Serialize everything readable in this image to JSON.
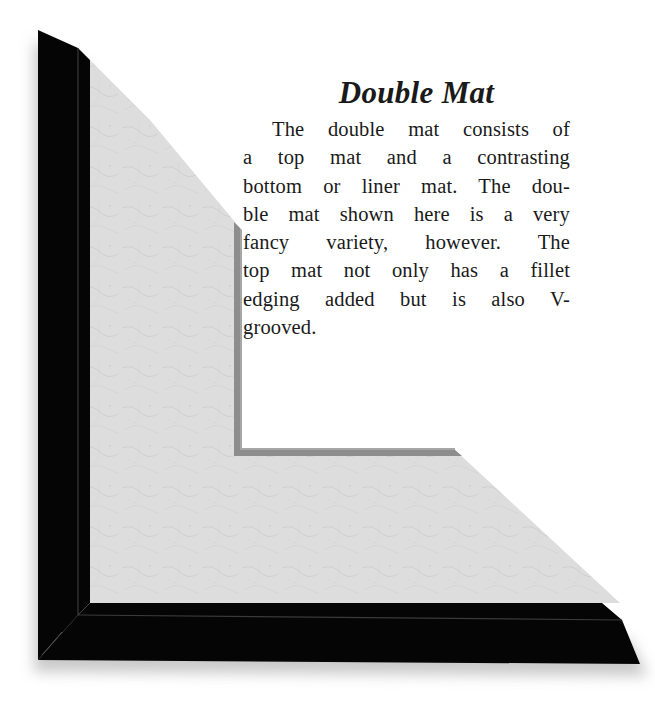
{
  "heading": "Double Mat",
  "body": {
    "lines": [
      "The double mat consists of",
      "a top mat and a contrasting",
      "bottom or liner mat. The dou-",
      "ble mat shown here is a very",
      "fancy variety, however. The",
      "top mat not only has a fillet",
      "edging added but is also V-",
      "grooved."
    ]
  },
  "illustration": {
    "subject": "corner of picture frame with double mat",
    "frame_color": "#050505",
    "frame_highlight": "#3a3a3a",
    "mat_color": "#dcdcdc",
    "liner_color": "#8d8d8d",
    "shadow_color": "#c8c8c8"
  }
}
